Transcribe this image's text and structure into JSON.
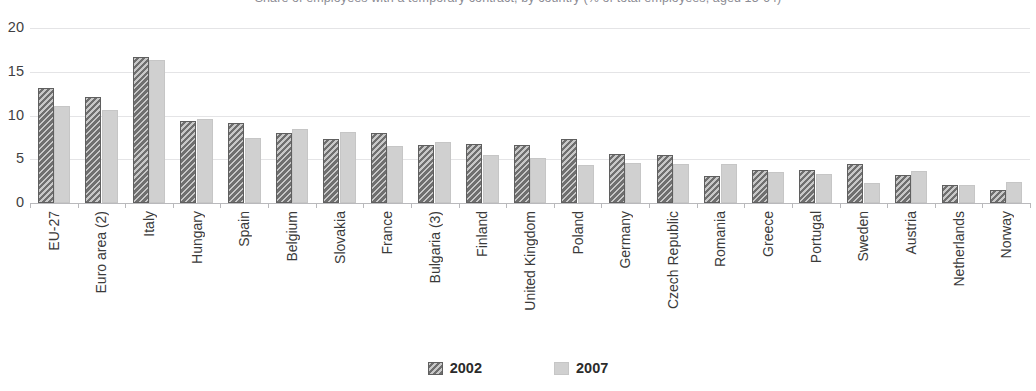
{
  "chart_data": {
    "type": "bar",
    "title": "Share of employees with a temporary contract, by country (% of total employees, aged 15-64)",
    "xlabel": "",
    "ylabel": "",
    "ylim": [
      0,
      20
    ],
    "yticks": [
      0,
      5,
      10,
      15,
      20
    ],
    "grid": true,
    "legend_position": "bottom-center",
    "categories": [
      "EU-27",
      "Euro area (2)",
      "Italy",
      "Hungary",
      "Spain",
      "Belgium",
      "Slovakia",
      "France",
      "Bulgaria (3)",
      "Finland",
      "United Kingdom",
      "Poland",
      "Germany",
      "Czech Republic",
      "Romania",
      "Greece",
      "Portugal",
      "Sweden",
      "Austria",
      "Netherlands",
      "Norway"
    ],
    "series": [
      {
        "name": "2002",
        "color": "#6f6f6f",
        "pattern": "diagonal-hatch",
        "values": [
          13.1,
          12.1,
          16.7,
          9.4,
          9.2,
          8.0,
          7.3,
          8.0,
          6.6,
          6.7,
          6.6,
          7.3,
          5.6,
          5.5,
          3.1,
          3.8,
          3.8,
          4.5,
          3.2,
          2.1,
          1.5
        ]
      },
      {
        "name": "2007",
        "color": "#d0d0d0",
        "pattern": "solid",
        "values": [
          11.1,
          10.6,
          16.3,
          9.6,
          7.4,
          8.5,
          8.1,
          6.5,
          7.0,
          5.5,
          5.2,
          4.4,
          4.6,
          4.5,
          4.5,
          3.5,
          3.3,
          2.3,
          3.7,
          2.1,
          2.4
        ]
      }
    ],
    "legend": [
      {
        "label": "2002",
        "swatch": "hatched-dark-gray"
      },
      {
        "label": "2007",
        "swatch": "solid-light-gray"
      }
    ],
    "colors": {
      "series_2002": "#6f6f6f",
      "series_2007": "#d0d0d0",
      "gridline": "#e4e4e6",
      "axis": "#b9b9bc",
      "text": "#3a3a3a",
      "background": "#ffffff"
    }
  }
}
